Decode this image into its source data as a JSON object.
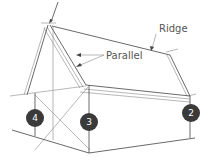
{
  "diagram": {
    "labels": {
      "ridge": "Ridge",
      "parallel": "Parallel"
    },
    "markers": [
      {
        "id": "4",
        "label": "4"
      },
      {
        "id": "3",
        "label": "3"
      },
      {
        "id": "2",
        "label": "2"
      }
    ],
    "colors": {
      "line": "#444444",
      "marker_fill": "#3a3a3a",
      "marker_text": "#ffffff",
      "label": "#555555"
    }
  }
}
